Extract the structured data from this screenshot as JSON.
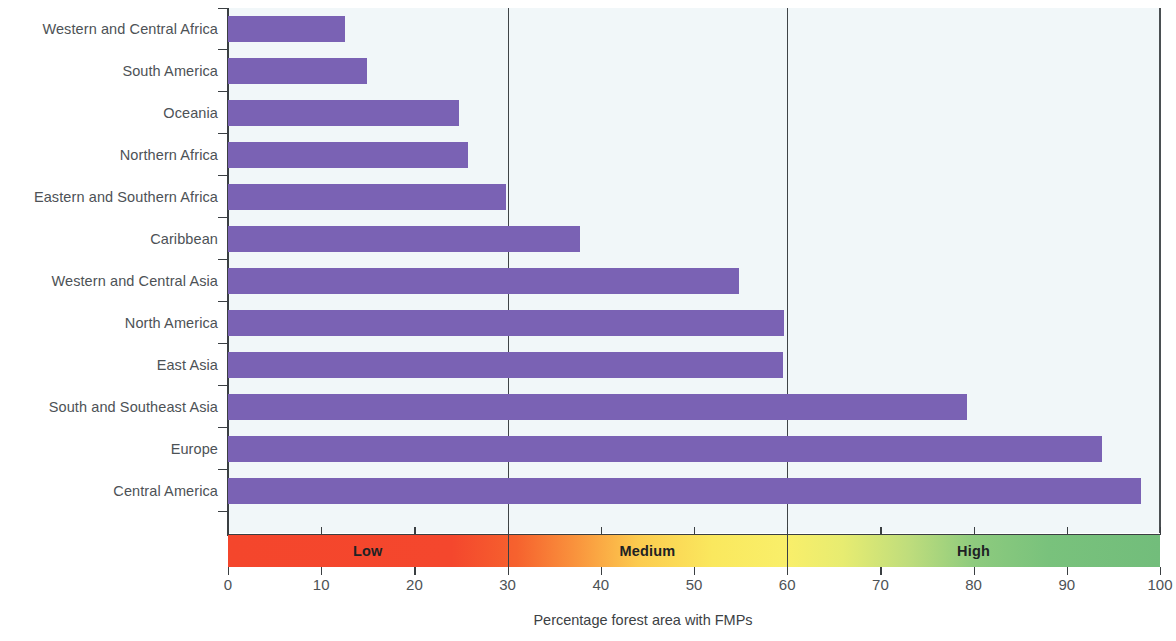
{
  "chart_data": {
    "type": "bar",
    "orientation": "horizontal",
    "title": "",
    "xlabel": "Percentage forest area with FMPs",
    "ylabel": "",
    "xlim": [
      0,
      100
    ],
    "xticks": [
      0,
      10,
      20,
      30,
      40,
      50,
      60,
      70,
      80,
      90,
      100
    ],
    "grid": false,
    "legend": "none",
    "reference_lines": [
      30,
      60
    ],
    "bar_color": "#7a62b4",
    "plot_background": "#f1f7f9",
    "categories": [
      "Western and Central Africa",
      "South America",
      "Oceania",
      "Northern Africa",
      "Eastern and Southern Africa",
      "Caribbean",
      "Western and Central Asia",
      "North America",
      "East Asia",
      "South and Southeast Asia",
      "Europe",
      "Central America"
    ],
    "values": [
      12.5,
      14.9,
      24.8,
      25.8,
      29.8,
      37.8,
      54.8,
      59.7,
      59.6,
      79.3,
      93.8,
      98.0
    ],
    "color_band": {
      "zones": [
        {
          "label": "Low",
          "from": 0,
          "to": 30,
          "start_color": "#f4462c",
          "end_color": "#f6622e"
        },
        {
          "label": "Medium",
          "from": 30,
          "to": 60,
          "start_color": "#f9913c",
          "end_color": "#f9ef6a"
        },
        {
          "label": "High",
          "from": 60,
          "to": 100,
          "start_color": "#e7ec71",
          "end_color": "#72bd7b"
        }
      ]
    }
  },
  "axis": {
    "title": "Percentage forest area with FMPs"
  }
}
